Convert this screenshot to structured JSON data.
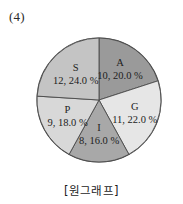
{
  "figure": {
    "item_number": "(4)",
    "caption": "[원그래프]"
  },
  "chart_data": {
    "type": "pie",
    "title": "",
    "subtitle": "",
    "xlabel": "",
    "ylabel": "",
    "legend_position": "none",
    "grid": false,
    "start_angle_deg": 0,
    "direction": "clockwise",
    "total": 50,
    "categories": [
      "A",
      "G",
      "I",
      "P",
      "S"
    ],
    "values": [
      10,
      11,
      8,
      9,
      12
    ],
    "percents": [
      20.0,
      22.0,
      16.0,
      18.0,
      24.0
    ],
    "colors": [
      "#9a9a9a",
      "#e6e6e6",
      "#a8a8a8",
      "#d8d8d8",
      "#c4c4c4"
    ],
    "slices": [
      {
        "name": "A",
        "value": 10,
        "percent": 20.0,
        "label_name": "A",
        "label_value": "10, 20.0 %",
        "color": "#9a9a9a",
        "start_deg": 0,
        "end_deg": 72
      },
      {
        "name": "G",
        "value": 11,
        "percent": 22.0,
        "label_name": "G",
        "label_value": "11, 22.0 %",
        "color": "#e6e6e6",
        "start_deg": 72,
        "end_deg": 151.2
      },
      {
        "name": "I",
        "value": 8,
        "percent": 16.0,
        "label_name": "I",
        "label_value": "8, 16.0 %",
        "color": "#a8a8a8",
        "start_deg": 151.2,
        "end_deg": 208.8
      },
      {
        "name": "P",
        "value": 9,
        "percent": 18.0,
        "label_name": "P",
        "label_value": "9, 18.0 %",
        "color": "#d8d8d8",
        "start_deg": 208.8,
        "end_deg": 273.6
      },
      {
        "name": "S",
        "value": 12,
        "percent": 24.0,
        "label_name": "S",
        "label_value": "12, 24.0 %",
        "color": "#c4c4c4",
        "start_deg": 273.6,
        "end_deg": 360
      }
    ],
    "geometry": {
      "cx": 99,
      "cy": 100,
      "r": 62
    }
  }
}
